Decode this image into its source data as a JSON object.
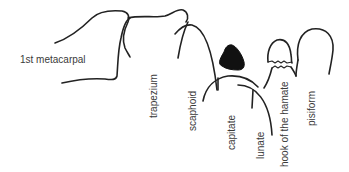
{
  "diagram": {
    "labels": {
      "first_metacarpal": "1st metacarpal",
      "trapezium": "trapezium",
      "scaphoid": "scaphoid",
      "capitate": "capitate",
      "lunate": "lunate",
      "hook_of_hamate": "hook of the hamate",
      "pisiform": "pisiform"
    },
    "colors": {
      "line": "#222222",
      "text": "#3a3a3a",
      "filled_shape": "#111111",
      "background": "#ffffff"
    }
  }
}
